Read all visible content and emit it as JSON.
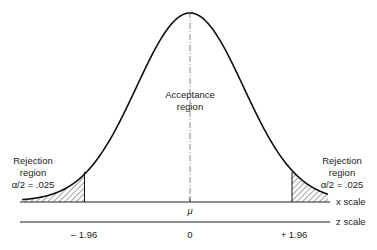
{
  "diagram": {
    "type": "normal-distribution-two-tailed-test",
    "acceptance_label_line1": "Acceptance",
    "acceptance_label_line2": "region",
    "left_rejection": {
      "line1": "Rejection",
      "line2": "region",
      "line3": "α/2  =  .025"
    },
    "right_rejection": {
      "line1": "Rejection",
      "line2": "region",
      "line3": "α/2  =  .025"
    },
    "mean_label": "μ",
    "x_scale_label": "x scale",
    "z_scale_label": "z scale",
    "z_ticks": {
      "left": "– 1.96",
      "center": "0",
      "right": "+ 1.96"
    },
    "colors": {
      "curve": "#111111",
      "text": "#222222",
      "hatch": "#333333",
      "axis": "#222222"
    }
  }
}
